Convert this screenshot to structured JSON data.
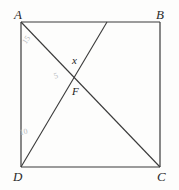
{
  "figure": {
    "type": "geometry-diagram",
    "shape": "square",
    "width": 179,
    "height": 190,
    "background_color": "#fdfdfc",
    "line_color": "#3a3a3a",
    "label_color": "#2b2b2b",
    "faint_label_color": "#b9bcc0"
  },
  "vertices": {
    "A": {
      "label": "A",
      "x": 21,
      "y": 22
    },
    "B": {
      "label": "B",
      "x": 160,
      "y": 22
    },
    "C": {
      "label": "C",
      "x": 160,
      "y": 167
    },
    "D": {
      "label": "D",
      "x": 21,
      "y": 167
    }
  },
  "points": {
    "F": {
      "label": "F",
      "x": 76,
      "y": 80
    },
    "x": {
      "label": "x"
    }
  },
  "segments": [
    {
      "name": "side-AB",
      "from": "A",
      "to": "B"
    },
    {
      "name": "side-BC",
      "from": "B",
      "to": "C"
    },
    {
      "name": "side-CD",
      "from": "C",
      "to": "D"
    },
    {
      "name": "side-DA",
      "from": "D",
      "to": "A"
    },
    {
      "name": "diagonal-AC",
      "from": "A",
      "to": "C"
    },
    {
      "name": "cevian-DE",
      "from": "D",
      "to": "E"
    }
  ],
  "top_edge_point": {
    "name": "E",
    "x": 107,
    "y": 22
  },
  "annotations": {
    "upper_left": "15",
    "center_left": "5",
    "lower_left": "10"
  }
}
